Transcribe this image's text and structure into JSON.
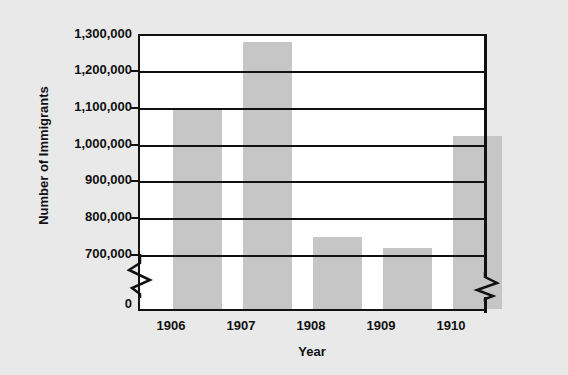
{
  "chart_data": {
    "type": "bar",
    "title": "",
    "xlabel": "Year",
    "ylabel": "Number of Immigrants",
    "categories": [
      "1906",
      "1907",
      "1908",
      "1909",
      "1910"
    ],
    "values": [
      1110000,
      1285000,
      785000,
      757000,
      1045000
    ],
    "series": [
      {
        "name": "Number of Immigrants",
        "values": [
          1110000,
          1285000,
          785000,
          757000,
          1045000
        ]
      }
    ],
    "ylim": [
      700000,
      1300000
    ],
    "y_axis_has_break": true,
    "y_zero_label": "0",
    "yticks": [
      700000,
      800000,
      900000,
      1000000,
      1100000,
      1200000,
      1300000
    ],
    "ytick_labels": [
      "1,300,000",
      "1,200,000",
      "1,100,000",
      "1,000,000",
      "900,000",
      "800,000",
      "700,000",
      "0"
    ],
    "grid": true,
    "grid_axis": "y",
    "legend": false,
    "legend_position": "none",
    "bar_color": "#c6c6c6",
    "axis_color": "#111111",
    "plot_background": "#ffffff",
    "figure_background": "#e9e9e9"
  },
  "axis": {
    "y_title": "Number of Immigrants",
    "x_title": "Year"
  }
}
